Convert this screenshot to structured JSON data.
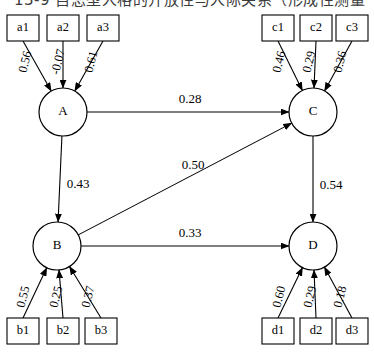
{
  "caption": {
    "text": "13-9  自恋型人格的开放性与人际关系（形成性测量"
  },
  "figure": {
    "type": "path-diagram"
  },
  "latents": [
    {
      "id": "A",
      "label": "A",
      "cx": 63,
      "cy": 112
    },
    {
      "id": "B",
      "label": "B",
      "cx": 57,
      "cy": 246
    },
    {
      "id": "C",
      "label": "C",
      "cx": 313,
      "cy": 112
    },
    {
      "id": "D",
      "label": "D",
      "cx": 313,
      "cy": 246
    }
  ],
  "indicators": [
    {
      "id": "a1",
      "label": "a1",
      "x": 7,
      "y": 15,
      "factor": "A",
      "loading": "0.56",
      "lx": 26,
      "ly": 62
    },
    {
      "id": "a2",
      "label": "a2",
      "x": 47,
      "y": 15,
      "factor": "A",
      "loading": "-0.07",
      "lx": 59,
      "ly": 62
    },
    {
      "id": "a3",
      "label": "a3",
      "x": 87,
      "y": 15,
      "factor": "A",
      "loading": "0.61",
      "lx": 92,
      "ly": 62
    },
    {
      "id": "c1",
      "label": "c1",
      "x": 262,
      "y": 15,
      "factor": "C",
      "loading": "0.46",
      "lx": 280,
      "ly": 62
    },
    {
      "id": "c2",
      "label": "c2",
      "x": 300,
      "y": 15,
      "factor": "C",
      "loading": "0.29",
      "lx": 310,
      "ly": 62
    },
    {
      "id": "c3",
      "label": "c3",
      "x": 336,
      "y": 15,
      "factor": "C",
      "loading": "0.36",
      "lx": 341,
      "ly": 62
    },
    {
      "id": "b1",
      "label": "b1",
      "x": 7,
      "y": 318,
      "factor": "B",
      "loading": "0.55",
      "lx": 24,
      "ly": 297
    },
    {
      "id": "b2",
      "label": "b2",
      "x": 47,
      "y": 318,
      "factor": "B",
      "loading": "0.25",
      "lx": 57,
      "ly": 297
    },
    {
      "id": "b3",
      "label": "b3",
      "x": 85,
      "y": 318,
      "factor": "B",
      "loading": "0.37",
      "lx": 89,
      "ly": 297
    },
    {
      "id": "d1",
      "label": "d1",
      "x": 262,
      "y": 318,
      "factor": "D",
      "loading": "0.60",
      "lx": 280,
      "ly": 297
    },
    {
      "id": "d2",
      "label": "d2",
      "x": 300,
      "y": 318,
      "factor": "D",
      "loading": "0.29",
      "lx": 311,
      "ly": 297
    },
    {
      "id": "d3",
      "label": "d3",
      "x": 336,
      "y": 318,
      "factor": "D",
      "loading": "0.18",
      "lx": 341,
      "ly": 297
    }
  ],
  "structural_paths": [
    {
      "id": "a-to-c",
      "from": "A",
      "to": "C",
      "value": "0.28",
      "lx": 190,
      "ly": 100
    },
    {
      "id": "a-to-b",
      "from": "A",
      "to": "B",
      "value": "0.43",
      "lx": 78,
      "ly": 185
    },
    {
      "id": "b-to-c",
      "from": "B",
      "to": "C",
      "value": "0.50",
      "lx": 193,
      "ly": 166
    },
    {
      "id": "c-to-d",
      "from": "C",
      "to": "D",
      "value": "0.54",
      "lx": 331,
      "ly": 186
    },
    {
      "id": "b-to-d",
      "from": "B",
      "to": "D",
      "value": "0.33",
      "lx": 190,
      "ly": 234
    }
  ],
  "geometry": {
    "box_width": 32,
    "box_height": 26,
    "circle_radius": 24
  }
}
